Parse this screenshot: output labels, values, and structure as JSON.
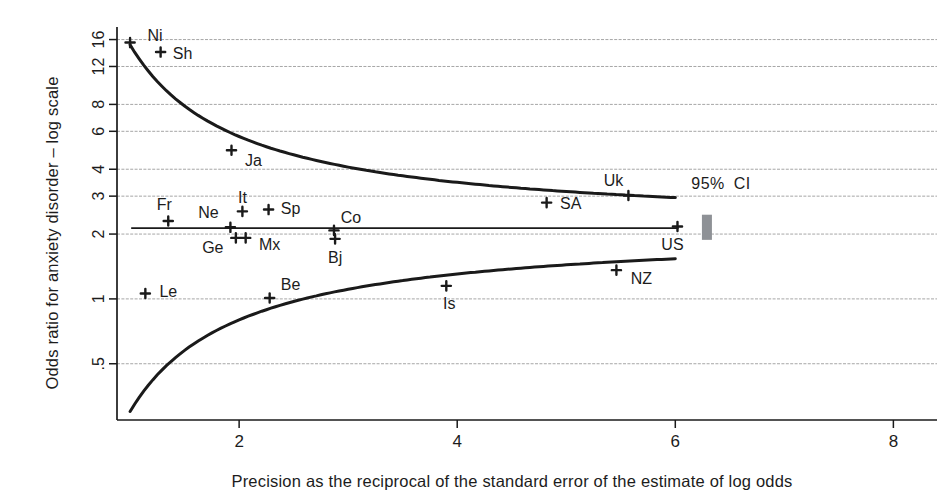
{
  "figure": {
    "x_axis_title": "Precision as the reciprocal of the standard error of the estimate of log odds",
    "y_axis_title": "Odds ratio for anxiety disorder – log scale",
    "ci_annotation": "95% CI"
  },
  "chart_data": {
    "type": "scatter",
    "subtype": "funnel-plot",
    "title": "",
    "xlabel": "Precision as the reciprocal of the standard error of the estimate of log odds",
    "ylabel": "Odds ratio for anxiety disorder – log scale",
    "y_scale": "log",
    "grid": "horizontal",
    "xlim": [
      0.88,
      8.4
    ],
    "ylim": [
      0.274,
      18.3
    ],
    "x_ticks": [
      2,
      4,
      6,
      8
    ],
    "y_ticks": [
      {
        "v": 16,
        "label": "16"
      },
      {
        "v": 12,
        "label": "12"
      },
      {
        "v": 8,
        "label": "8"
      },
      {
        "v": 6,
        "label": "6"
      },
      {
        "v": 4,
        "label": "4"
      },
      {
        "v": 3,
        "label": "3"
      },
      {
        "v": 2,
        "label": "2"
      },
      {
        "v": 1,
        "label": "1"
      },
      {
        "v": 0.5,
        "label": ".5"
      }
    ],
    "points": [
      {
        "id": "Ni",
        "x": 1.0,
        "or": 15.5,
        "dx": 25,
        "dy": -7
      },
      {
        "id": "Sh",
        "x": 1.28,
        "or": 14.0,
        "dx": 22,
        "dy": 1
      },
      {
        "id": "Ja",
        "x": 1.93,
        "or": 4.9,
        "dx": 22,
        "dy": 10
      },
      {
        "id": "Fr",
        "x": 1.35,
        "or": 2.3,
        "dx": -4,
        "dy": -16
      },
      {
        "id": "Ne",
        "x": 1.92,
        "or": 2.15,
        "dx": -22,
        "dy": -15
      },
      {
        "id": "It",
        "x": 2.03,
        "or": 2.55,
        "dx": 0,
        "dy": -14
      },
      {
        "id": "Sp",
        "x": 2.27,
        "or": 2.6,
        "dx": 22,
        "dy": -1
      },
      {
        "id": "Ge",
        "x": 1.97,
        "or": 1.92,
        "dx": -23,
        "dy": 10
      },
      {
        "id": "Mx",
        "x": 2.06,
        "or": 1.92,
        "dx": 24,
        "dy": 7
      },
      {
        "id": "Co",
        "x": 2.87,
        "or": 2.08,
        "dx": 17,
        "dy": -13
      },
      {
        "id": "Bj",
        "x": 2.88,
        "or": 1.9,
        "dx": 0,
        "dy": 19
      },
      {
        "id": "SA",
        "x": 4.82,
        "or": 2.8,
        "dx": 24,
        "dy": 1
      },
      {
        "id": "Uk",
        "x": 5.57,
        "or": 3.02,
        "dx": -15,
        "dy": -15
      },
      {
        "id": "US",
        "x": 6.02,
        "or": 2.17,
        "dx": -5,
        "dy": 18
      },
      {
        "id": "NZ",
        "x": 5.46,
        "or": 1.36,
        "dx": 25,
        "dy": 8
      },
      {
        "id": "Is",
        "x": 3.9,
        "or": 1.15,
        "dx": 3,
        "dy": 18
      },
      {
        "id": "Be",
        "x": 2.28,
        "or": 1.01,
        "dx": 21,
        "dy": -13
      },
      {
        "id": "Le",
        "x": 1.14,
        "or": 1.06,
        "dx": 23,
        "dy": -2
      }
    ],
    "pooled_estimate": {
      "or": 2.13,
      "x_start": 1.01,
      "x_end": 6.03
    },
    "funnel_limits": {
      "center_or": 2.13,
      "z": 1.96,
      "x_start": 1.0,
      "x_end": 6.0
    },
    "ci_bar": {
      "x": 6.29,
      "or_low": 1.88,
      "or_high": 2.46
    },
    "annotation": {
      "text": "95% CI",
      "x": 6.42,
      "or": 3.42
    },
    "colors": {
      "line": "#1a1a1a",
      "grid": "#a6a6a6",
      "ci_bar": "#8e9196",
      "text": "#1c1c1c"
    }
  }
}
